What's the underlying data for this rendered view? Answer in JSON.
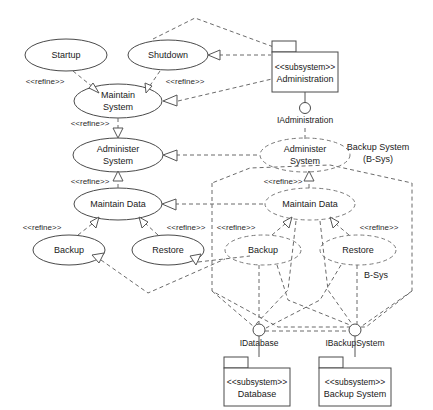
{
  "diagram": {
    "stereotype": "<<subsystem>>",
    "refine_label": "<<refine>>"
  },
  "usecases": {
    "startup": "Startup",
    "shutdown": "Shutdown",
    "maintain_system_l1": "Maintain",
    "maintain_system_l2": "System",
    "administer_system_l1": "Administer",
    "administer_system_l2": "System",
    "maintain_data": "Maintain Data",
    "backup": "Backup",
    "restore": "Restore",
    "bsys_administer_l1": "Administer",
    "bsys_administer_l2": "System",
    "bsys_maintain_data": "Maintain Data",
    "bsys_backup": "Backup",
    "bsys_restore": "Restore"
  },
  "refine_labels": {
    "startup_to_maintain": "<<refine>>",
    "shutdown_to_maintain": "<<refine>>",
    "maintain_to_administer": "<<refine>>",
    "administer_to_data": "<<refine>>",
    "data_to_backup": "<<refine>>",
    "data_to_restore": "<<refine>>",
    "bsys_admin_to_data": "<<refine>>",
    "bsys_data_to_backup": "<<refine>>",
    "bsys_data_to_restore": "<<refine>>"
  },
  "packages": {
    "administration": {
      "stereotype": "<<subsystem>>",
      "name": "Administration"
    },
    "database": {
      "stereotype": "<<subsystem>>",
      "name": "Database"
    },
    "backup_system": {
      "stereotype": "<<subsystem>>",
      "name": "Backup System"
    }
  },
  "interfaces": {
    "administration": "IAdministration",
    "database": "IDatabase",
    "backup_system": "IBackupSystem"
  },
  "boundaries": {
    "backup_system_title_l1": "Backup System",
    "backup_system_title_l2": "(B-Sys)",
    "bsys_tag": "B-Sys"
  },
  "colors": {
    "stroke_solid": "#4a4a4a",
    "stroke_dashed": "#6b6b6b",
    "background": "#ffffff",
    "text": "#1a1a1a"
  }
}
